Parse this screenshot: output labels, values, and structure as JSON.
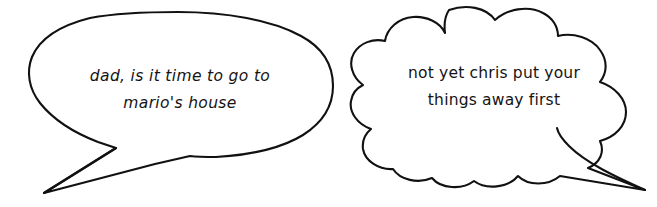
{
  "scene": {
    "title": "Two comic speech balloons dialogue",
    "width": 657,
    "height": 207,
    "background_color": "#ffffff",
    "ink_color": "#111111"
  },
  "bubbles": [
    {
      "id": "left-speech-bubble",
      "shape": "ellipse",
      "tail": "angular-zigzag-pointing-down-left",
      "speaker_role": "child",
      "lines": [
        "dad, is it time to go to",
        "mario's house"
      ],
      "full_text": "dad, is it time to go to mario's house"
    },
    {
      "id": "right-thought-cloud-bubble",
      "shape": "scalloped-cloud",
      "tail": "curved-swoosh-pointing-down-right",
      "speaker_role": "dad",
      "lines": [
        "not yet chris put your",
        "things away first"
      ],
      "full_text": "not yet chris put your things away first"
    }
  ]
}
